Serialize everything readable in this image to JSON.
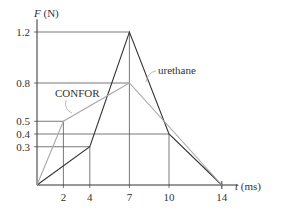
{
  "chart_data": {
    "type": "line",
    "title": "",
    "xlabel": "t (ms)",
    "ylabel": "F (N)",
    "x_ticks": [
      2,
      4,
      7,
      10,
      14
    ],
    "y_ticks": [
      0.3,
      0.4,
      0.5,
      0.8,
      1.2
    ],
    "x_tick_labels": [
      "2",
      "4",
      "7",
      "10",
      "14"
    ],
    "y_tick_labels": [
      "0.3",
      "0.4",
      "0.5",
      "0.8",
      "1.2"
    ],
    "xlim": [
      0,
      14
    ],
    "ylim": [
      0,
      1.2
    ],
    "grid": false,
    "series": [
      {
        "name": "urethane",
        "color": "#333333",
        "x": [
          0,
          4,
          7,
          10,
          14
        ],
        "y": [
          0,
          0.3,
          1.2,
          0.4,
          0
        ]
      },
      {
        "name": "CONFOR",
        "color": "#aaaaaa",
        "x": [
          0,
          2,
          7,
          14
        ],
        "y": [
          0,
          0.5,
          0.8,
          0
        ]
      }
    ],
    "annotations": [
      {
        "text": "urethane",
        "x_px": 158,
        "y_px": 73
      },
      {
        "text": "CONFOR",
        "x_px": 55,
        "y_px": 96
      }
    ]
  },
  "labels": {
    "y_axis_var": "F",
    "y_axis_unit": " (N)",
    "x_axis_var": "t",
    "x_axis_unit": " (ms)"
  }
}
